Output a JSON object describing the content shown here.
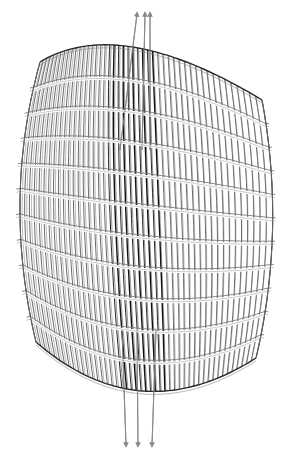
{
  "diagram": {
    "type": "architectural-line-drawing",
    "width": 295,
    "height": 455,
    "colors": {
      "background": "#ffffff",
      "outline": "#2a2a2a",
      "fin": "#3a3a3a",
      "fin_dark": "#111111",
      "band": "#7a7a7a",
      "band_light": "#bdbdbd",
      "arrow": "#8a8a8a"
    },
    "outline": {
      "top_y_left": 62,
      "top_y_mid": 34,
      "top_y_right": 100,
      "bottom_y_left": 342,
      "bottom_y_mid": 410,
      "bottom_y_right": 358,
      "left_x_top": 40,
      "left_x_mid": 14,
      "left_x_bottom": 36,
      "right_x_top": 262,
      "right_x_mid": 278,
      "right_x_bottom": 256
    },
    "bands": 11,
    "fins": 46,
    "dark_fin_zone": {
      "start": 0.38,
      "end": 0.6
    },
    "arrows": [
      {
        "name": "up-arrow-1",
        "x1": 120,
        "y1": 150,
        "x2": 137,
        "y2": 14,
        "dir": "up"
      },
      {
        "name": "up-arrow-2",
        "x1": 142,
        "y1": 150,
        "x2": 145,
        "y2": 14,
        "dir": "up"
      },
      {
        "name": "up-arrow-3",
        "x1": 150,
        "y1": 150,
        "x2": 150,
        "y2": 14,
        "dir": "up"
      },
      {
        "name": "down-arrow-1",
        "x1": 122,
        "y1": 330,
        "x2": 126,
        "y2": 445,
        "dir": "down"
      },
      {
        "name": "down-arrow-2",
        "x1": 137,
        "y1": 330,
        "x2": 138,
        "y2": 445,
        "dir": "down"
      },
      {
        "name": "down-arrow-3",
        "x1": 156,
        "y1": 330,
        "x2": 152,
        "y2": 445,
        "dir": "down"
      }
    ]
  }
}
